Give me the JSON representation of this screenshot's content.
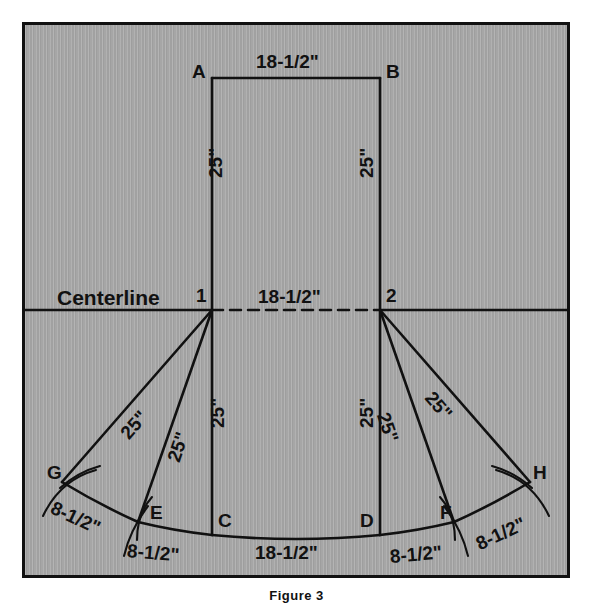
{
  "figure": {
    "caption": "Figure 3",
    "centerline_label": "Centerline"
  },
  "points": {
    "A": "A",
    "B": "B",
    "C": "C",
    "D": "D",
    "E": "E",
    "F": "F",
    "G": "G",
    "H": "H",
    "one": "1",
    "two": "2"
  },
  "dimensions": {
    "top_AB": "18-1/2\"",
    "mid_12": "18-1/2\"",
    "bottom_CD": "18-1/2\"",
    "left_A1": "25\"",
    "right_B2": "25\"",
    "left_1C": "25\"",
    "right_2D": "25\"",
    "one_to_G": "25\"",
    "one_to_E": "25\"",
    "two_to_F": "25\"",
    "two_to_H": "25\"",
    "G_to_E": "8-1/2\"",
    "E_to_C": "8-1/2\"",
    "D_to_F": "8-1/2\"",
    "F_to_H": "8-1/2\""
  },
  "geometry": {
    "note": "symmetric trapezoid layout about vertical axis x=296",
    "coords": {
      "A": [
        212,
        78
      ],
      "B": [
        380,
        78
      ],
      "one": [
        212,
        310
      ],
      "two": [
        380,
        310
      ],
      "C": [
        212,
        535
      ],
      "D": [
        380,
        535
      ],
      "E": [
        138,
        522
      ],
      "F": [
        454,
        522
      ],
      "G": [
        62,
        482
      ],
      "H": [
        530,
        482
      ]
    },
    "centerline_y": 310,
    "frame": [
      22,
      22,
      548,
      556
    ]
  },
  "colors": {
    "background": "#a6a6a6",
    "ink": "#111111",
    "frame": "#111111",
    "page": "#ffffff"
  }
}
